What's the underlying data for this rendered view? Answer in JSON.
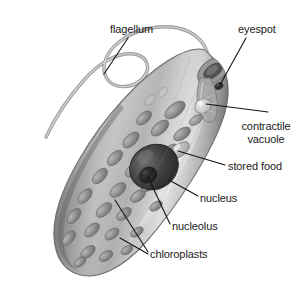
{
  "figure": {
    "style": "grayscale labeled biology diagram",
    "background_color": "#ffffff",
    "width": 305,
    "height": 297
  },
  "palette": {
    "outline": "#6b6b6b",
    "body_light": "#e2e2e2",
    "body_mid": "#b4b4b4",
    "body_dark": "#8a8a8a",
    "body_shadow": "#6f6f6f",
    "chloroplast_fill": "#8e8e8e",
    "chloroplast_dark": "#6e6e6e",
    "chloroplast_light": "#c6c6c6",
    "nucleus_fill": "#3f3f3f",
    "nucleolus_fill": "#1f1f1f",
    "eyespot_fill": "#3a3a3a",
    "flagellum_stroke": "#8c8c8c",
    "leader_line": "#141414",
    "text_color": "#1a1a1a"
  },
  "labels": [
    {
      "id": "flagellum",
      "text": "flagellum",
      "x": 110,
      "y": 23,
      "lines": 1,
      "leader": {
        "x1": 128,
        "y1": 38,
        "x2": 104,
        "y2": 74
      }
    },
    {
      "id": "eyespot",
      "text": "eyespot",
      "x": 238,
      "y": 23,
      "lines": 1,
      "leader": {
        "x1": 246,
        "y1": 38,
        "x2": 220,
        "y2": 85
      }
    },
    {
      "id": "contractile-vacuole",
      "text": "contractile vacuole",
      "x": 232,
      "y": 121,
      "lines": 2,
      "leader": {
        "x1": 268,
        "y1": 112,
        "x2": 206,
        "y2": 104
      }
    },
    {
      "id": "stored-food",
      "text": "stored food",
      "x": 228,
      "y": 161,
      "lines": 1,
      "leader": {
        "x1": 225,
        "y1": 165,
        "x2": 178,
        "y2": 151
      }
    },
    {
      "id": "nucleus",
      "text": "nucleus",
      "x": 200,
      "y": 193,
      "lines": 1,
      "leader": {
        "x1": 198,
        "y1": 196,
        "x2": 169,
        "y2": 180
      }
    },
    {
      "id": "nucleolus",
      "text": "nucleolus",
      "x": 172,
      "y": 221,
      "lines": 1,
      "leader": {
        "x1": 170,
        "y1": 224,
        "x2": 148,
        "y2": 177
      }
    },
    {
      "id": "chloroplasts",
      "text": "chloroplasts",
      "x": 150,
      "y": 249,
      "lines": 1,
      "leaders": [
        {
          "x1": 148,
          "y1": 252,
          "x2": 115,
          "y2": 200
        },
        {
          "x1": 148,
          "y1": 254,
          "x2": 120,
          "y2": 238
        }
      ]
    }
  ],
  "structures": {
    "cell_body": {
      "name": "cell-body",
      "description": "elongated spindle-shaped pellicle tilted about 35 degrees"
    },
    "flagellum": {
      "name": "flagellum",
      "description": "long wavy whip emerging from anterior reservoir"
    },
    "reservoir": {
      "name": "reservoir-gullet",
      "description": "funnel opening at anterior end"
    },
    "eyespot": {
      "name": "eyespot",
      "description": "dark pigment spot beside reservoir"
    },
    "contractile_vacuole": {
      "name": "contractile-vacuole",
      "description": "clear vesicle near reservoir base"
    },
    "nucleus": {
      "name": "nucleus",
      "description": "large dark central sphere"
    },
    "nucleolus": {
      "name": "nucleolus",
      "description": "darker inner body within nucleus"
    },
    "stored_food": {
      "name": "stored-food",
      "description": "paramylon granule near nucleus"
    },
    "chloroplasts": {
      "name": "chloroplasts",
      "count_visible": 28,
      "description": "oval plastids scattered through cytoplasm"
    }
  }
}
